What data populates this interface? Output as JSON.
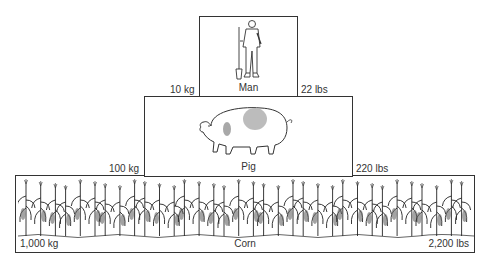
{
  "pyramid": {
    "levels": [
      {
        "name": "Man",
        "mass_metric": "10 kg",
        "mass_imperial": "22 lbs",
        "icon": "man-icon"
      },
      {
        "name": "Pig",
        "mass_metric": "100 kg",
        "mass_imperial": "220 lbs",
        "icon": "pig-icon"
      },
      {
        "name": "Corn",
        "mass_metric": "1,000 kg",
        "mass_imperial": "2,200 lbs",
        "icon": "corn-plants-icon"
      }
    ]
  },
  "colors": {
    "border": "#333333",
    "pig_spot": "#b0b0b0",
    "background": "#ffffff"
  }
}
